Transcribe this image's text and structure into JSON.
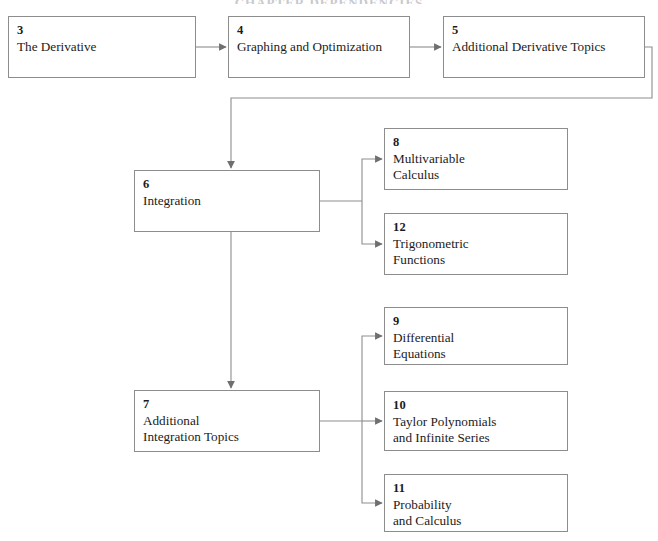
{
  "diagram": {
    "title": "CHAPTER DEPENDENCIES",
    "line_color": "#8d8d8d",
    "text_color": "#1b1b1b",
    "background": "#ffffff",
    "nodes": [
      {
        "id": "ch3",
        "number": "3",
        "lines": [
          "The Derivative"
        ],
        "x": 8,
        "y": 16,
        "w": 188,
        "h": 62
      },
      {
        "id": "ch4",
        "number": "4",
        "lines": [
          "Graphing and Optimization"
        ],
        "x": 228,
        "y": 16,
        "w": 182,
        "h": 62
      },
      {
        "id": "ch5",
        "number": "5",
        "lines": [
          "Additional Derivative Topics"
        ],
        "x": 443,
        "y": 16,
        "w": 202,
        "h": 62
      },
      {
        "id": "ch6",
        "number": "6",
        "lines": [
          "Integration"
        ],
        "x": 134,
        "y": 170,
        "w": 186,
        "h": 62
      },
      {
        "id": "ch8",
        "number": "8",
        "lines": [
          "Multivariable",
          "Calculus"
        ],
        "x": 384,
        "y": 128,
        "w": 184,
        "h": 62
      },
      {
        "id": "ch12",
        "number": "12",
        "lines": [
          "Trigonometric",
          "Functions"
        ],
        "x": 384,
        "y": 213,
        "w": 184,
        "h": 62
      },
      {
        "id": "ch7",
        "number": "7",
        "lines": [
          "Additional",
          "Integration Topics"
        ],
        "x": 134,
        "y": 390,
        "w": 186,
        "h": 62
      },
      {
        "id": "ch9",
        "number": "9",
        "lines": [
          "Differential",
          "Equations"
        ],
        "x": 384,
        "y": 307,
        "w": 184,
        "h": 58
      },
      {
        "id": "ch10",
        "number": "10",
        "lines": [
          "Taylor Polynomials",
          "and Infinite Series"
        ],
        "x": 384,
        "y": 391,
        "w": 184,
        "h": 60
      },
      {
        "id": "ch11",
        "number": "11",
        "lines": [
          "Probability",
          "and Calculus"
        ],
        "x": 384,
        "y": 474,
        "w": 184,
        "h": 58
      }
    ],
    "edges": [
      {
        "id": "e-3-4",
        "from": "ch3",
        "to": "ch4",
        "label": "The Derivative to Graphing and Optimization"
      },
      {
        "id": "e-4-5",
        "from": "ch4",
        "to": "ch5",
        "label": "Graphing and Optimization to Additional Derivative Topics"
      },
      {
        "id": "e-5-6",
        "from": "ch5",
        "to": "ch6",
        "label": "Additional Derivative Topics to Integration"
      },
      {
        "id": "e-6-8",
        "from": "ch6",
        "to": "ch8",
        "label": "Integration to Multivariable Calculus"
      },
      {
        "id": "e-6-12",
        "from": "ch6",
        "to": "ch12",
        "label": "Integration to Trigonometric Functions"
      },
      {
        "id": "e-6-7",
        "from": "ch6",
        "to": "ch7",
        "label": "Integration to Additional Integration Topics"
      },
      {
        "id": "e-7-9",
        "from": "ch7",
        "to": "ch9",
        "label": "Additional Integration Topics to Differential Equations"
      },
      {
        "id": "e-7-10",
        "from": "ch7",
        "to": "ch10",
        "label": "Additional Integration Topics to Taylor Polynomials and Infinite Series"
      },
      {
        "id": "e-7-11",
        "from": "ch7",
        "to": "ch11",
        "label": "Additional Integration Topics to Probability and Calculus"
      }
    ]
  }
}
